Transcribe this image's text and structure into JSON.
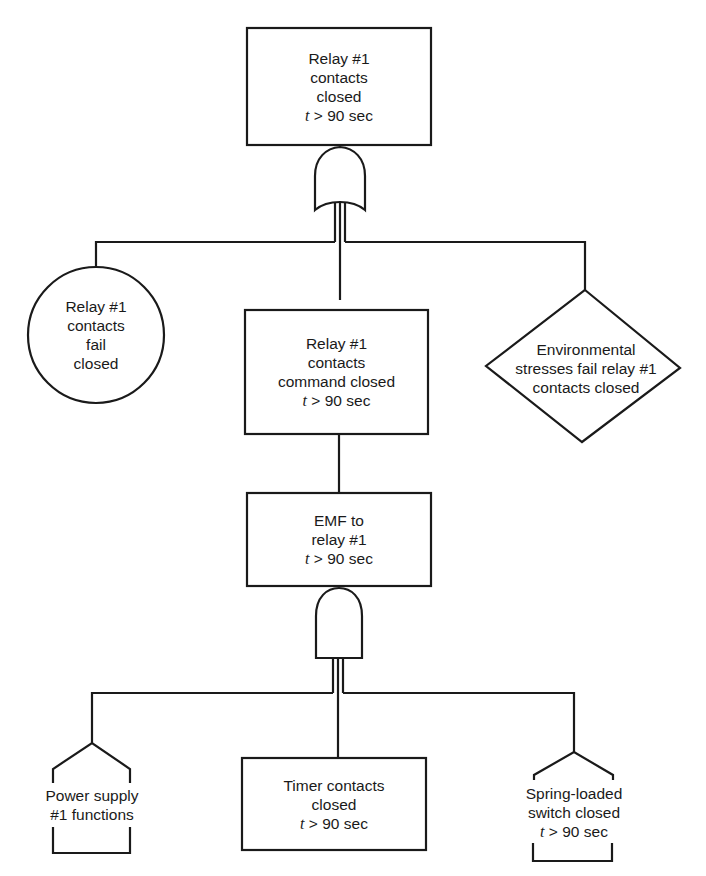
{
  "diagram": {
    "type": "fault_tree",
    "line_color": "#1a1a1a",
    "background": "#ffffff",
    "top_event": {
      "shape": "rectangle",
      "lines": [
        "Relay #1",
        "contacts",
        "closed"
      ],
      "time_var": "t",
      "time_cond": " > 90 sec"
    },
    "gate_1": {
      "type": "OR",
      "label": "or-gate"
    },
    "level_2": {
      "basic_event": {
        "shape": "circle",
        "lines": [
          "Relay #1",
          "contacts",
          "fail",
          "closed"
        ]
      },
      "command_event": {
        "shape": "rectangle",
        "lines": [
          "Relay #1",
          "contacts",
          "command closed"
        ],
        "time_var": "t",
        "time_cond": " > 90 sec"
      },
      "undeveloped_event": {
        "shape": "diamond",
        "lines": [
          "Environmental",
          "stresses fail relay #1",
          "contacts closed"
        ]
      }
    },
    "level_3": {
      "emf_event": {
        "shape": "rectangle",
        "lines": [
          "EMF to",
          "relay #1"
        ],
        "time_var": "t",
        "time_cond": " > 90 sec"
      }
    },
    "gate_2": {
      "type": "AND",
      "label": "and-gate"
    },
    "level_4": {
      "power_supply": {
        "shape": "house",
        "lines": [
          "Power supply",
          "#1 functions"
        ]
      },
      "timer_contacts": {
        "shape": "rectangle",
        "lines": [
          "Timer contacts",
          "closed"
        ],
        "time_var": "t",
        "time_cond": " > 90 sec"
      },
      "spring_switch": {
        "shape": "house",
        "lines": [
          "Spring-loaded",
          "switch closed"
        ],
        "time_var": "t",
        "time_cond": " > 90 sec"
      }
    }
  }
}
